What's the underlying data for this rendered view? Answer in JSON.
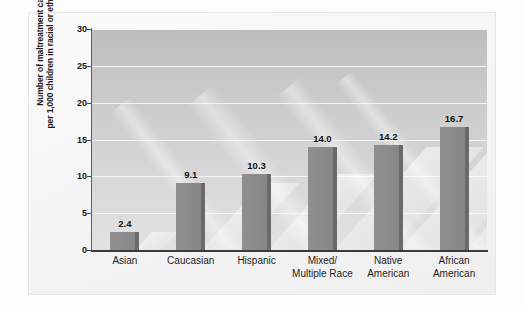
{
  "chart_data": {
    "type": "bar",
    "title": "",
    "subtitle": "",
    "xlabel": "",
    "ylabel": "Number of maltreatment cases per 1,000 children in racial or ethnic group",
    "ylabel_lines": [
      "Number of maltreatment cases",
      "per 1,000 children in racial or ethnic group"
    ],
    "categories": [
      "Asian",
      "Caucasian",
      "Hispanic",
      "Mixed/ Multiple Race",
      "Native American",
      "African American"
    ],
    "category_lines": [
      [
        "Asian",
        ""
      ],
      [
        "Caucasian",
        ""
      ],
      [
        "Hispanic",
        ""
      ],
      [
        "Mixed/",
        "Multiple Race"
      ],
      [
        "Native",
        "American"
      ],
      [
        "African",
        "American"
      ]
    ],
    "values": [
      2.4,
      9.1,
      10.3,
      14.0,
      14.2,
      16.7
    ],
    "value_labels": [
      "2.4",
      "9.1",
      "10.3",
      "14.0",
      "14.2",
      "16.7"
    ],
    "ylim": [
      0,
      30
    ],
    "ytick_values": [
      0,
      5,
      10,
      15,
      20,
      25,
      30
    ],
    "ytick_labels": [
      "0",
      "5",
      "10",
      "15",
      "20",
      "25",
      "30"
    ],
    "grid": true,
    "grid_axis": "y",
    "legend": false,
    "legend_position": "none",
    "colors": {
      "bar_face": "#8b8b8b",
      "bar_side": "#6a6a6a",
      "gridline": "#f4f4f4",
      "axis": "#3b3b3b",
      "plot_background_top": "#bdbdbd",
      "plot_background_bottom": "#e2e2e2",
      "figure_background": "#fbfbfb",
      "text": "#161616"
    }
  }
}
